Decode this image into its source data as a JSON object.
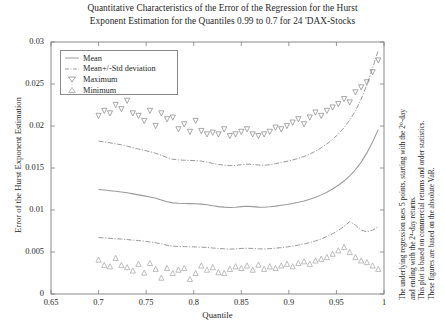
{
  "chart_data": {
    "type": "line",
    "title": "Quantitative Characteristics of the Error of the Regression for the Hurst Exponent Estimation for the Quantiles 0.99 to 0.7 for 24 'DAX-Stocks",
    "title_line1": "Quantitative Characteristics of the Error of the Regression for the Hurst",
    "title_line2": "Exponent Estimation for the Quantiles 0.99 to 0.7 for 24 'DAX-Stocks",
    "xlabel": "Quantile",
    "ylabel": "Error of the Hurst Exponent Estimation",
    "xlim": [
      0.65,
      1.0
    ],
    "ylim": [
      0,
      0.03
    ],
    "xticks": [
      0.65,
      0.7,
      0.75,
      0.8,
      0.85,
      0.9,
      0.95,
      1
    ],
    "xticklabels": [
      "0.65",
      "0.7",
      "0.75",
      "0.8",
      "0.85",
      "0.9",
      "0.95",
      "1"
    ],
    "yticks": [
      0,
      0.005,
      0.01,
      0.015,
      0.02,
      0.025,
      0.03
    ],
    "yticklabels": [
      "0",
      "0.005",
      "0.01",
      "0.015",
      "0.02",
      "0.025",
      "0.03"
    ],
    "grid": false,
    "legend_position": "upper-left",
    "x": [
      0.7,
      0.706,
      0.712,
      0.718,
      0.724,
      0.73,
      0.736,
      0.742,
      0.748,
      0.754,
      0.76,
      0.766,
      0.772,
      0.778,
      0.784,
      0.79,
      0.796,
      0.802,
      0.808,
      0.814,
      0.82,
      0.826,
      0.832,
      0.838,
      0.844,
      0.85,
      0.856,
      0.862,
      0.868,
      0.874,
      0.88,
      0.886,
      0.892,
      0.898,
      0.904,
      0.91,
      0.916,
      0.922,
      0.928,
      0.934,
      0.94,
      0.946,
      0.952,
      0.958,
      0.964,
      0.97,
      0.976,
      0.982,
      0.988,
      0.994
    ],
    "series": [
      {
        "name": "Mean",
        "style": "solid",
        "values": [
          0.01245,
          0.01238,
          0.0123,
          0.01222,
          0.01215,
          0.01205,
          0.01192,
          0.0118,
          0.01168,
          0.01155,
          0.0114,
          0.0112,
          0.01098,
          0.01085,
          0.0108,
          0.01078,
          0.01076,
          0.01074,
          0.0107,
          0.01062,
          0.0105,
          0.0104,
          0.01034,
          0.0103,
          0.01032,
          0.0104,
          0.01044,
          0.0104,
          0.01034,
          0.01032,
          0.01038,
          0.01046,
          0.01056,
          0.01066,
          0.01078,
          0.01092,
          0.01108,
          0.01128,
          0.01152,
          0.0118,
          0.01212,
          0.0125,
          0.01295,
          0.01345,
          0.01405,
          0.0148,
          0.0157,
          0.0168,
          0.0181,
          0.0196
        ]
      },
      {
        "name": "Mean+/-Std deviation",
        "style": "dashdot",
        "upper": [
          0.0182,
          0.0181,
          0.018,
          0.01788,
          0.01775,
          0.0176,
          0.01742,
          0.01726,
          0.0171,
          0.01694,
          0.01676,
          0.01652,
          0.01624,
          0.01604,
          0.01596,
          0.01592,
          0.0159,
          0.01588,
          0.01582,
          0.0157,
          0.01555,
          0.01542,
          0.01534,
          0.01528,
          0.0153,
          0.0154,
          0.01546,
          0.01542,
          0.01535,
          0.01532,
          0.0154,
          0.01552,
          0.01566,
          0.0158,
          0.01596,
          0.01615,
          0.01638,
          0.01666,
          0.017,
          0.0174,
          0.01786,
          0.0184,
          0.01904,
          0.0198,
          0.0207,
          0.0218,
          0.0232,
          0.0249,
          0.0269,
          0.029
        ],
        "lower": [
          0.00672,
          0.00668,
          0.00663,
          0.00658,
          0.00654,
          0.00648,
          0.00642,
          0.00636,
          0.00628,
          0.0062,
          0.0061,
          0.00596,
          0.0058,
          0.0057,
          0.00566,
          0.00564,
          0.00562,
          0.0056,
          0.00558,
          0.00554,
          0.00548,
          0.00542,
          0.00538,
          0.00535,
          0.00536,
          0.00542,
          0.00545,
          0.00542,
          0.00538,
          0.00536,
          0.0054,
          0.00546,
          0.00552,
          0.0056,
          0.0057,
          0.00582,
          0.00596,
          0.00612,
          0.00632,
          0.00656,
          0.00684,
          0.00718,
          0.00758,
          0.00806,
          0.00862,
          0.0082,
          0.0076,
          0.0074,
          0.0076,
          0.008
        ]
      },
      {
        "name": "Maximum",
        "style": "marker-down",
        "values": [
          0.0212,
          0.0218,
          0.0215,
          0.0225,
          0.022,
          0.023,
          0.0215,
          0.0212,
          0.0206,
          0.0218,
          0.02,
          0.0215,
          0.0208,
          0.021,
          0.0196,
          0.0202,
          0.0193,
          0.0206,
          0.0194,
          0.019,
          0.0192,
          0.019,
          0.0196,
          0.0188,
          0.019,
          0.0193,
          0.0196,
          0.019,
          0.0188,
          0.019,
          0.0193,
          0.0198,
          0.0196,
          0.02,
          0.0204,
          0.0208,
          0.0202,
          0.021,
          0.0216,
          0.0212,
          0.0218,
          0.0222,
          0.0226,
          0.0232,
          0.0228,
          0.024,
          0.0246,
          0.0252,
          0.0264,
          0.0278
        ]
      },
      {
        "name": "Minimum",
        "style": "marker-up",
        "values": [
          0.0041,
          0.00345,
          0.0033,
          0.0043,
          0.00345,
          0.0032,
          0.0028,
          0.0036,
          0.00255,
          0.0037,
          0.003,
          0.00195,
          0.0031,
          0.0025,
          0.0029,
          0.0031,
          0.0018,
          0.0025,
          0.0034,
          0.0029,
          0.0032,
          0.0026,
          0.0025,
          0.003,
          0.0033,
          0.0031,
          0.0034,
          0.0029,
          0.0035,
          0.003,
          0.0033,
          0.0031,
          0.0034,
          0.0036,
          0.0033,
          0.0037,
          0.0039,
          0.0036,
          0.004,
          0.0042,
          0.0044,
          0.0048,
          0.0052,
          0.0056,
          0.005,
          0.0044,
          0.004,
          0.0038,
          0.0034,
          0.003
        ]
      }
    ],
    "legend": [
      {
        "label": "Mean",
        "symbol": "solid-line"
      },
      {
        "label": "Mean+/-Std deviation",
        "symbol": "dashdot-line"
      },
      {
        "label": "Maximum",
        "symbol": "triangle-down-marker"
      },
      {
        "label": "Minimum",
        "symbol": "triangle-up-marker"
      }
    ],
    "annotations": [
      "The underlying regression uses 5 points, starting with the 2⁰-day",
      "and ending with the 2⁴-day returns.",
      "This plot is based on commercial returns and order statistics.",
      "These figures are based on the absolute VaR."
    ],
    "colors": {
      "line": "#9a9a9a",
      "marker": "#8c8c8c",
      "axis": "#7d7d7d",
      "text": "#1f1f1f",
      "background": "#ffffff"
    }
  }
}
